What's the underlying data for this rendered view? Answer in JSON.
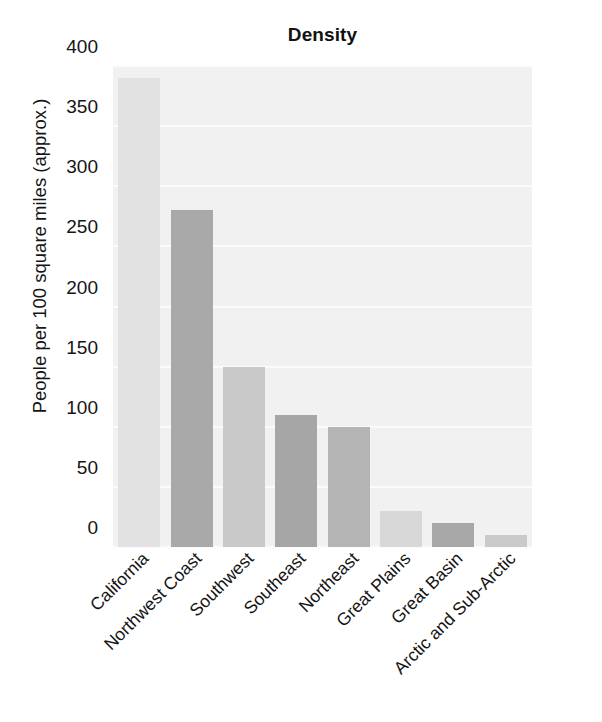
{
  "chart_data": {
    "type": "bar",
    "title": "Density",
    "xlabel": "",
    "ylabel": "People per 100 square miles (approx.)",
    "categories": [
      "California",
      "Northwest Coast",
      "Southwest",
      "Southeast",
      "Northeast",
      "Great Plains",
      "Great Basin",
      "Arctic and Sub-Arctic"
    ],
    "values": [
      390,
      280,
      150,
      110,
      100,
      30,
      20,
      10
    ],
    "ylim": [
      0,
      400
    ],
    "yticks": [
      0,
      50,
      100,
      150,
      200,
      250,
      300,
      350,
      400
    ],
    "ytick_labels": [
      "0",
      "50",
      "100",
      "150",
      "200",
      "250",
      "300",
      "350",
      "400"
    ],
    "grid": true,
    "grid_axis": "y",
    "legend": false,
    "bar_colors": [
      "#e2e2e2",
      "#a9a9a9",
      "#c9c9c9",
      "#a6a6a6",
      "#b4b4b4",
      "#d8d8d8",
      "#a8a8a8",
      "#cacaca"
    ],
    "plot_background": "#f1f1f1",
    "gridline_color": "#fbfbfb",
    "x_label_rotation": -45
  }
}
